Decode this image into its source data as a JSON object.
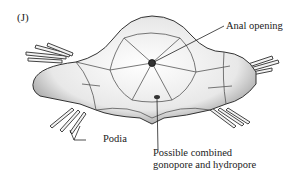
{
  "figure": {
    "panel_label": "(J)",
    "labels": {
      "anal_opening": "Anal opening",
      "podia": "Podia",
      "pore_line1": "Possible combined",
      "pore_line2": "gonopore and hydropore"
    }
  }
}
